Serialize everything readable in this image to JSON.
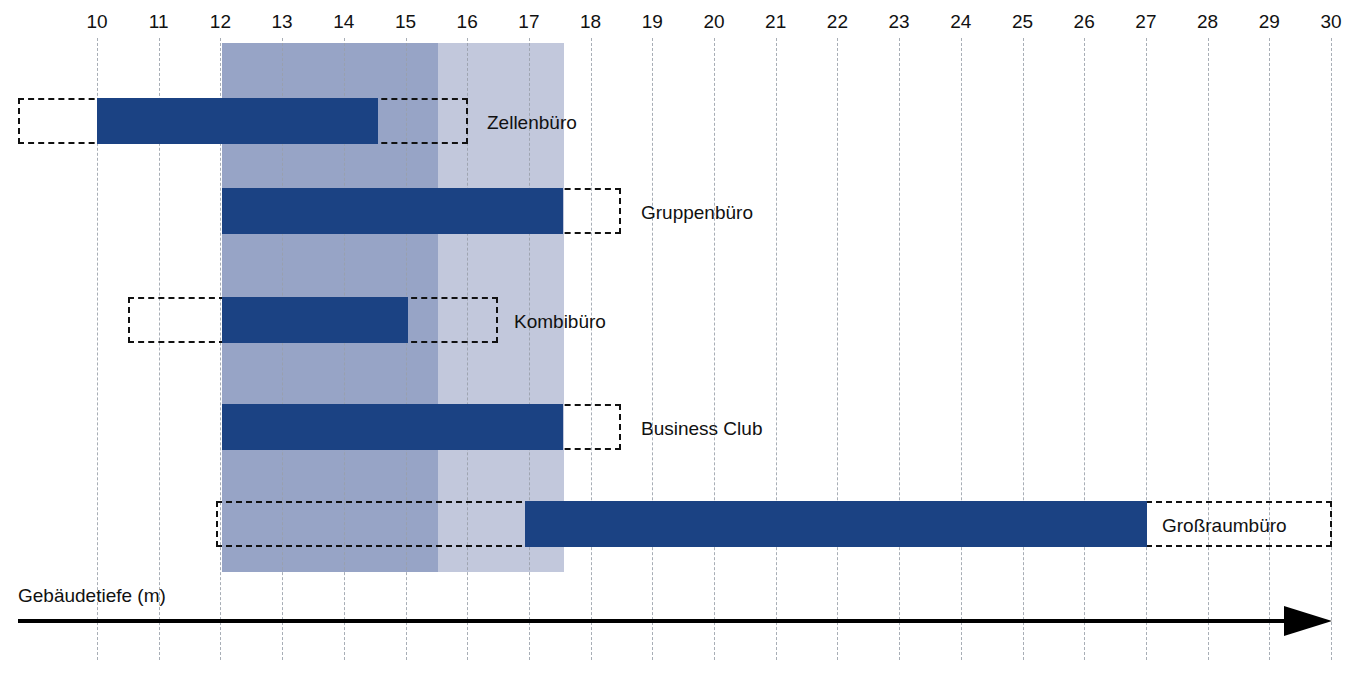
{
  "chart_data": {
    "type": "bar",
    "title": "",
    "subtitle": "",
    "orientation": "horizontal",
    "xlabel": "Gebäudetiefe (m)",
    "ylabel": "",
    "xlim": [
      10,
      30
    ],
    "xticks": [
      10,
      11,
      12,
      13,
      14,
      15,
      16,
      17,
      18,
      19,
      20,
      21,
      22,
      23,
      24,
      25,
      26,
      27,
      28,
      29,
      30
    ],
    "xtick_labels": [
      "10",
      "11",
      "12",
      "13",
      "14",
      "15",
      "16",
      "17",
      "18",
      "19",
      "20",
      "21",
      "22",
      "23",
      "24",
      "25",
      "26",
      "27",
      "28",
      "29",
      "30"
    ],
    "grid": true,
    "grid_style": "dashed-vertical",
    "legend": null,
    "categories": [
      "Zellenbüro",
      "Gruppenbüro",
      "Kombibüro",
      "Business Club",
      "Großraumbüro"
    ],
    "series": [
      {
        "name": "Typischer Bereich (solid)",
        "color": "#1b4283",
        "ranges": [
          {
            "category": "Zellenbüro",
            "start": 10.0,
            "end": 14.5
          },
          {
            "category": "Gruppenbüro",
            "start": 12.0,
            "end": 17.5
          },
          {
            "category": "Kombibüro",
            "start": 12.0,
            "end": 15.0
          },
          {
            "category": "Business Club",
            "start": 12.0,
            "end": 17.5
          },
          {
            "category": "Großraumbüro",
            "start": 17.0,
            "end": 27.0
          }
        ]
      },
      {
        "name": "Möglicher Bereich (gestrichelt)",
        "color": "#111111",
        "ranges": [
          {
            "category": "Zellenbüro",
            "start": 8.7,
            "end": 16.0
          },
          {
            "category": "Gruppenbüro",
            "start": 12.0,
            "end": 18.5
          },
          {
            "category": "Kombibüro",
            "start": 11.1,
            "end": 16.4
          },
          {
            "category": "Business Club",
            "start": 12.0,
            "end": 18.5
          },
          {
            "category": "Großraumbüro",
            "start": 11.9,
            "end": 30.0
          }
        ]
      }
    ],
    "shaded_bands": [
      {
        "name": "dunkles Band",
        "start": 12.0,
        "end": 15.5,
        "color": "#97a4c6"
      },
      {
        "name": "helles Band",
        "start": 15.5,
        "end": 17.55,
        "color": "#c2c8dc"
      }
    ],
    "annotations": []
  },
  "axis": {
    "title": "Gebäudetiefe (m)",
    "arrow_icon": "right-arrow-icon"
  },
  "rows": [
    {
      "label": "Zellenbüro"
    },
    {
      "label": "Gruppenbüro"
    },
    {
      "label": "Kombibüro"
    },
    {
      "label": "Business Club"
    },
    {
      "label": "Großraumbüro"
    }
  ],
  "ticks": [
    "10",
    "11",
    "12",
    "13",
    "14",
    "15",
    "16",
    "17",
    "18",
    "19",
    "20",
    "21",
    "22",
    "23",
    "24",
    "25",
    "26",
    "27",
    "28",
    "29",
    "30"
  ]
}
